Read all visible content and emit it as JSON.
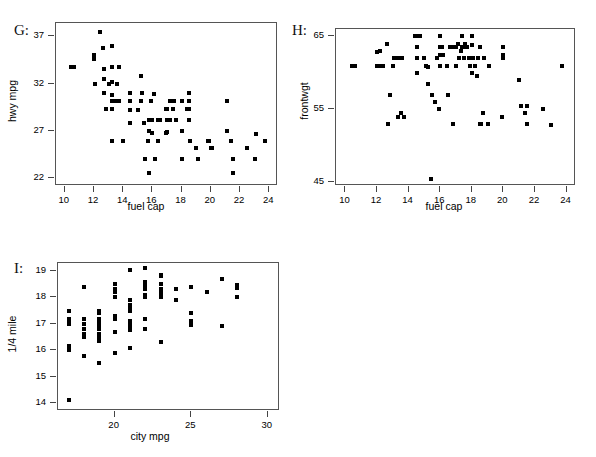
{
  "figure": {
    "background": "#ffffff",
    "point_color": "#000000",
    "frame_color": "#555555",
    "panels": [
      "G",
      "H",
      "I"
    ]
  },
  "chart_data": [
    {
      "type": "scatter",
      "panel_label": "G:",
      "title": "",
      "xlabel": "fuel cap",
      "ylabel": "hwy mpg",
      "xlim": [
        9.4,
        24.6
      ],
      "ylim": [
        21.2,
        38.4
      ],
      "xticks": [
        10,
        12,
        14,
        16,
        18,
        20,
        22,
        24
      ],
      "yticks": [
        22,
        27,
        32,
        37
      ],
      "grid": false,
      "legend": "none",
      "x": [
        10.4,
        10.6,
        12.0,
        12.0,
        12.1,
        12.4,
        12.6,
        12.7,
        12.7,
        12.7,
        12.8,
        13.0,
        13.2,
        13.2,
        13.2,
        13.2,
        13.2,
        13.2,
        13.2,
        13.5,
        13.6,
        13.6,
        13.7,
        13.7,
        14.0,
        14.5,
        14.5,
        14.5,
        14.5,
        15.0,
        15.2,
        15.2,
        15.3,
        15.4,
        15.5,
        15.7,
        15.8,
        15.8,
        15.8,
        15.9,
        16.0,
        16.0,
        16.0,
        16.0,
        16.1,
        16.2,
        16.4,
        16.4,
        16.5,
        16.9,
        16.9,
        17.0,
        17.0,
        17.0,
        17.2,
        17.2,
        17.4,
        17.5,
        17.6,
        18.0,
        18.0,
        18.0,
        18.4,
        18.5,
        18.5,
        18.5,
        18.5,
        18.6,
        19.0,
        19.1,
        19.8,
        19.9,
        20.0,
        20.0,
        20.1,
        21.1,
        21.1,
        21.4,
        21.5,
        21.5,
        22.5,
        23.0,
        23.1,
        23.7
      ],
      "y": [
        33.8,
        33.8,
        35.0,
        34.6,
        32.0,
        37.5,
        35.8,
        33.5,
        32.5,
        31.0,
        29.3,
        32.0,
        36.0,
        33.8,
        32.2,
        30.8,
        29.3,
        30.2,
        26.0,
        30.2,
        32.0,
        30.2,
        33.8,
        30.2,
        26.0,
        27.8,
        30.2,
        31.0,
        29.2,
        29.2,
        32.8,
        30.2,
        31.0,
        27.8,
        24.0,
        26.0,
        28.2,
        27.0,
        22.6,
        30.2,
        28.2,
        28.2,
        28.2,
        26.8,
        30.9,
        24.0,
        26.0,
        28.2,
        28.2,
        29.3,
        26.8,
        28.2,
        26.9,
        29.3,
        30.2,
        28.2,
        29.3,
        30.2,
        28.2,
        30.2,
        27.0,
        24.0,
        29.3,
        31.0,
        30.2,
        29.3,
        28.2,
        26.0,
        25.2,
        24.0,
        26.0,
        26.0,
        25.2,
        25.2,
        25.2,
        30.2,
        27.0,
        26.0,
        24.0,
        22.6,
        25.2,
        24.0,
        26.7,
        26.0
      ]
    },
    {
      "type": "scatter",
      "panel_label": "H:",
      "title": "",
      "xlabel": "fuel cap",
      "ylabel": "frontwgt",
      "xlim": [
        9.4,
        24.6
      ],
      "ylim": [
        44.5,
        66.0
      ],
      "xticks": [
        10,
        12,
        14,
        16,
        18,
        20,
        22,
        24
      ],
      "yticks": [
        45,
        55,
        65
      ],
      "grid": false,
      "legend": "none",
      "x": [
        10.4,
        10.6,
        12.0,
        12.0,
        12.1,
        12.2,
        12.4,
        12.6,
        12.7,
        12.8,
        13.0,
        13.1,
        13.2,
        13.3,
        13.4,
        13.4,
        13.5,
        13.6,
        13.7,
        14.4,
        14.5,
        14.5,
        14.5,
        14.6,
        14.7,
        15.0,
        15.1,
        15.2,
        15.2,
        15.4,
        15.5,
        15.7,
        15.8,
        15.9,
        16.0,
        16.0,
        16.0,
        16.0,
        16.1,
        16.2,
        16.4,
        16.5,
        16.6,
        16.8,
        16.9,
        17.0,
        17.0,
        17.1,
        17.2,
        17.3,
        17.4,
        17.4,
        17.5,
        17.5,
        17.6,
        17.7,
        17.8,
        17.9,
        18.0,
        18.0,
        18.0,
        18.1,
        18.2,
        18.3,
        18.4,
        18.5,
        18.5,
        18.6,
        18.7,
        18.8,
        19.0,
        19.1,
        19.9,
        20.0,
        20.0,
        20.0,
        21.0,
        21.1,
        21.4,
        21.5,
        21.5,
        22.5,
        23.0,
        23.7
      ],
      "y": [
        61.0,
        61.0,
        62.9,
        61.0,
        61.0,
        63.0,
        61.0,
        64.0,
        53.0,
        57.0,
        61.0,
        62.0,
        62.0,
        54.0,
        62.0,
        62.0,
        54.5,
        62.0,
        54.0,
        65.0,
        63.5,
        62.0,
        60.0,
        65.0,
        65.0,
        62.0,
        61.0,
        60.8,
        58.5,
        45.5,
        57.0,
        56.0,
        62.0,
        55.0,
        65.0,
        63.5,
        62.5,
        61.0,
        63.5,
        62.5,
        61.0,
        57.0,
        63.5,
        53.0,
        63.5,
        63.5,
        61.0,
        64.0,
        62.0,
        63.0,
        65.0,
        63.5,
        63.5,
        62.0,
        64.0,
        63.5,
        62.0,
        61.0,
        65.0,
        63.8,
        60.0,
        62.0,
        61.0,
        59.5,
        62.0,
        63.5,
        53.0,
        53.0,
        54.5,
        62.0,
        53.0,
        61.0,
        54.0,
        63.5,
        62.5,
        62.0,
        59.0,
        55.5,
        54.5,
        55.5,
        53.0,
        55.0,
        52.8,
        61.0
      ]
    },
    {
      "type": "scatter",
      "panel_label": "I:",
      "title": "",
      "xlabel": "city mpg",
      "ylabel": "1/4 mile",
      "xlim": [
        16.3,
        30.8
      ],
      "ylim": [
        13.7,
        19.3
      ],
      "xticks": [
        20,
        25,
        30
      ],
      "yticks": [
        14,
        15,
        16,
        17,
        18,
        19
      ],
      "grid": false,
      "legend": "none",
      "x": [
        17,
        17,
        17,
        17,
        17,
        17,
        17,
        18,
        18,
        18,
        18,
        18,
        18,
        18,
        19,
        19,
        19,
        19,
        19,
        19,
        19,
        19,
        19,
        19,
        19,
        19,
        19,
        20,
        20,
        20,
        20,
        20,
        20,
        20,
        20,
        21,
        21,
        21,
        21,
        21,
        21,
        21,
        21,
        21,
        21,
        21,
        21,
        21,
        21,
        22,
        22,
        22,
        22,
        22,
        22,
        22,
        22,
        22,
        23,
        23,
        23,
        23,
        23,
        23,
        23,
        23,
        23,
        23,
        24,
        24,
        25,
        25,
        25,
        25,
        26,
        27,
        27,
        28,
        28,
        28
      ],
      "y": [
        17.5,
        17.2,
        17.1,
        17.0,
        16.15,
        16.0,
        14.1,
        18.4,
        17.2,
        17.0,
        16.8,
        16.6,
        16.5,
        15.8,
        17.5,
        17.4,
        17.2,
        17.1,
        17.0,
        16.95,
        16.9,
        16.85,
        16.8,
        16.6,
        16.5,
        16.35,
        15.5,
        18.5,
        18.3,
        18.2,
        18.0,
        17.3,
        17.2,
        16.7,
        15.9,
        19.05,
        17.9,
        17.7,
        17.6,
        17.55,
        17.5,
        17.1,
        17.0,
        16.95,
        16.9,
        16.85,
        16.8,
        16.75,
        16.1,
        19.1,
        18.6,
        18.5,
        18.45,
        18.3,
        18.1,
        18.0,
        17.2,
        16.8,
        18.85,
        18.8,
        18.5,
        18.3,
        18.25,
        18.2,
        18.15,
        18.1,
        18.0,
        16.3,
        18.3,
        17.9,
        18.4,
        17.4,
        17.1,
        16.95,
        18.2,
        18.7,
        16.9,
        18.45,
        18.35,
        18.0
      ]
    }
  ]
}
